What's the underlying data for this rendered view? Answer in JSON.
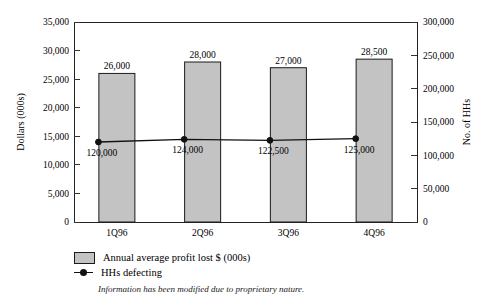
{
  "chart_data": {
    "type": "bar",
    "categories": [
      "1Q96",
      "2Q96",
      "3Q96",
      "4Q96"
    ],
    "series": [
      {
        "name": "Annual average profit lost $ (000s)",
        "type": "bar",
        "axis": "left",
        "values": [
          26000,
          28000,
          27000,
          28500
        ],
        "labels": [
          "26,000",
          "28,000",
          "27,000",
          "28,500"
        ],
        "color": "#c3c3c3"
      },
      {
        "name": "HHs defecting",
        "type": "line",
        "axis": "right",
        "values": [
          120000,
          124000,
          122500,
          125000
        ],
        "labels": [
          "120,000",
          "124,000",
          "122,500",
          "125,000"
        ],
        "color": "#111111"
      }
    ],
    "title": "",
    "xlabel": "",
    "ylabel": "Dollars (000s)",
    "y2label": "No. of HHs",
    "ylim": [
      0,
      35000
    ],
    "y2lim": [
      0,
      300000
    ],
    "yticks": [
      "0",
      "5,000",
      "10,000",
      "15,000",
      "20,000",
      "25,000",
      "30,000",
      "35,000"
    ],
    "ytick_values": [
      0,
      5000,
      10000,
      15000,
      20000,
      25000,
      30000,
      35000
    ],
    "y2ticks": [
      "0",
      "50,000",
      "100,000",
      "150,000",
      "200,000",
      "250,000",
      "300,000"
    ],
    "y2tick_values": [
      0,
      50000,
      100000,
      150000,
      200000,
      250000,
      300000
    ],
    "grid": false,
    "legend_position": "bottom-left"
  },
  "legend": {
    "items": [
      {
        "label": "Annual average profit lost $ (000s)",
        "marker": "square-swatch"
      },
      {
        "label": "HHs defecting",
        "marker": "line-with-dot"
      }
    ]
  },
  "footnote": "Information has been modified due to proprietary nature."
}
